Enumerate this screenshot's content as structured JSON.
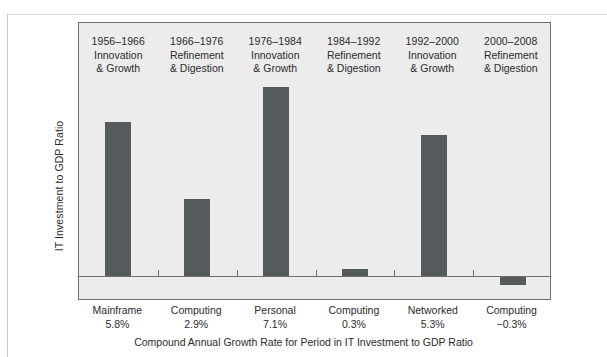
{
  "page": {
    "cropped_caption": ""
  },
  "chart_data": {
    "type": "bar",
    "title": "",
    "xlabel": "Compound Annual Growth Rate for Period in IT Investment to GDP Ratio",
    "ylabel": "IT Investment to GDP Ratio",
    "grid": false,
    "legend": false,
    "bar_color": "#555a5c",
    "plot_background": "#ececec",
    "text_color": "#2b2b2b",
    "ylim": [
      -0.3,
      7.6
    ],
    "categories": [
      "Mainframe 5.8%",
      "Computing 2.9%",
      "Personal 7.1%",
      "Computing 0.3%",
      "Networked 5.3%",
      "Computing −0.3%"
    ],
    "values": [
      5.8,
      2.9,
      7.1,
      0.3,
      5.3,
      -0.3
    ],
    "bars": [
      {
        "period_years": "1956–1966",
        "period_line1": "Innovation",
        "period_line2": "& Growth",
        "tick_line1": "Mainframe",
        "tick_line2": "5.8%",
        "value": 5.8
      },
      {
        "period_years": "1966–1976",
        "period_line1": "Refinement",
        "period_line2": "& Digestion",
        "tick_line1": "Computing",
        "tick_line2": "2.9%",
        "value": 2.9
      },
      {
        "period_years": "1976–1984",
        "period_line1": "Innovation",
        "period_line2": "& Growth",
        "tick_line1": "Personal",
        "tick_line2": "7.1%",
        "value": 7.1
      },
      {
        "period_years": "1984–1992",
        "period_line1": "Refinement",
        "period_line2": "& Digestion",
        "tick_line1": "Computing",
        "tick_line2": "0.3%",
        "value": 0.3
      },
      {
        "period_years": "1992–2000",
        "period_line1": "Innovation",
        "period_line2": "& Growth",
        "tick_line1": "Networked",
        "tick_line2": "5.3%",
        "value": 5.3
      },
      {
        "period_years": "2000–2008",
        "period_line1": "Refinement",
        "period_line2": "& Digestion",
        "tick_line1": "Computing",
        "tick_line2": "−0.3%",
        "value": -0.3
      }
    ]
  }
}
